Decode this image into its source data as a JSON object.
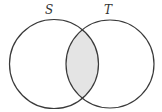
{
  "diagram": {
    "type": "venn",
    "sets": [
      {
        "label": "S",
        "cx": 54,
        "cy": 64,
        "r": 44.5,
        "label_x": 49,
        "label_y": 14
      },
      {
        "label": "T",
        "cx": 110,
        "cy": 64,
        "r": 44,
        "label_x": 108,
        "label_y": 14
      }
    ],
    "shaded_region": "S ∩ T",
    "colors": {
      "stroke": "#3a3a3a",
      "shade": "#e4e4e4",
      "background": "#ffffff"
    }
  }
}
